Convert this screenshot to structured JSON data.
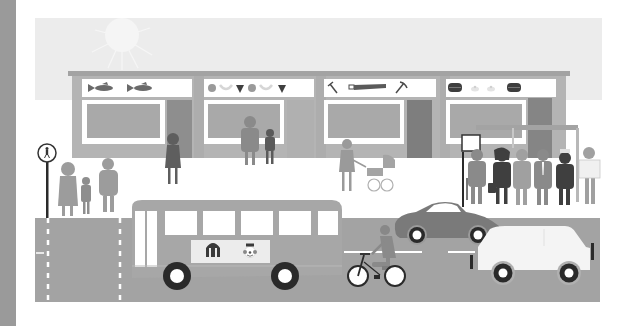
{
  "scene": {
    "title": "Street scene illustration",
    "description": "Grayscale illustration of a shopping street with shops, pedestrians, bus stop and traffic",
    "colors": {
      "left_bar": "#9a9a9a",
      "sky": "#ececec",
      "sun": "#f3f3f3",
      "building": "#b4b4b4",
      "roof": "#a6a6a6",
      "sign_board": "#ffffff",
      "window_frame": "#ffffff",
      "window_glass": "#a9a9a9",
      "door": "#8e8e8e",
      "road": "#a3a3a3",
      "lane_mark": "#ffffff",
      "bus": "#a7a7a7",
      "dark_car": "#7a7a7a",
      "white_car": "#f4f4f4",
      "wheel": "#2a2a2a",
      "person_light": "#9c9c9c",
      "person_dark": "#5a5a5a"
    },
    "shops": [
      {
        "name": "fish-shop",
        "sign_icons": [
          "fish-icon",
          "fish-icon"
        ]
      },
      {
        "name": "fruit-shop",
        "sign_icons": [
          "apple-icon",
          "banana-icon",
          "strawberry-icon",
          "apple-icon",
          "banana-icon",
          "strawberry-icon"
        ]
      },
      {
        "name": "hardware-shop",
        "sign_icons": [
          "hammer-icon",
          "saw-icon",
          "pickaxe-icon"
        ]
      },
      {
        "name": "bakery-shop",
        "sign_icons": [
          "cake-icon",
          "bun-icon",
          "bun-icon",
          "cake-icon"
        ]
      }
    ],
    "bus": {
      "ad_icons": [
        "circus-tent-icon",
        "clown-icon"
      ]
    },
    "sign": {
      "icon": "pedestrian-icon"
    }
  }
}
